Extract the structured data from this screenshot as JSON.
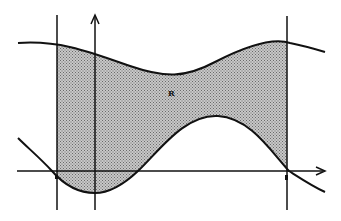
{
  "diagram": {
    "region_label": "R",
    "colors": {
      "stroke": "#111111",
      "shade": "#b0b0b0",
      "background": "#ffffff"
    },
    "axes": {
      "x_axis_arrow": true,
      "y_axis_arrow": true
    },
    "vertical_lines": [
      "left-boundary",
      "right-boundary"
    ],
    "curves": [
      "upper-curve",
      "lower-curve"
    ]
  }
}
